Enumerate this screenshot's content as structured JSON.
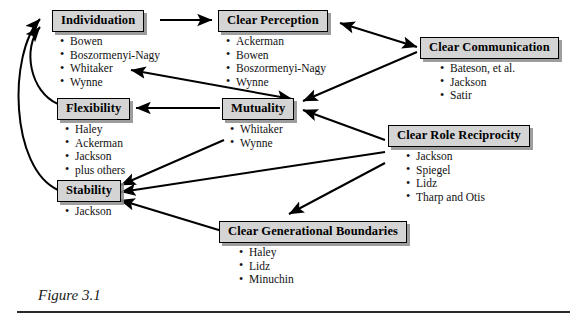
{
  "figure": {
    "caption": "Figure 3.1",
    "bullet_glyph": "•",
    "colors": {
      "box_fill": "#d4d4d4",
      "box_border": "#000000",
      "box_shadow": "#8c8c8c",
      "text": "#111111",
      "arrow": "#000000",
      "background": "#ffffff"
    }
  },
  "nodes": [
    {
      "id": "individuation",
      "title": "Individuation",
      "items": [
        "Bowen",
        "Boszormenyi-Nagy",
        "Whitaker",
        "Wynne"
      ]
    },
    {
      "id": "clear_perception",
      "title": "Clear Perception",
      "items": [
        "Ackerman",
        "Bowen",
        "Boszormenyi-Nagy",
        "Wynne"
      ]
    },
    {
      "id": "clear_communication",
      "title": "Clear Communication",
      "items": [
        "Bateson, et al.",
        "Jackson",
        "Satir"
      ]
    },
    {
      "id": "flexibility",
      "title": "Flexibility",
      "items": [
        "Haley",
        "Ackerman",
        "Jackson",
        "plus others"
      ]
    },
    {
      "id": "mutuality",
      "title": "Mutuality",
      "items": [
        "Whitaker",
        "Wynne"
      ]
    },
    {
      "id": "clear_role_reciprocity",
      "title": "Clear Role Reciprocity",
      "items": [
        "Jackson",
        "Spiegel",
        "Lidz",
        "Tharp and Otis"
      ]
    },
    {
      "id": "stability",
      "title": "Stability",
      "items": [
        "Jackson"
      ]
    },
    {
      "id": "clear_generational_boundaries",
      "title": "Clear Generational Boundaries",
      "items": [
        "Haley",
        "Lidz",
        "Minuchin"
      ]
    }
  ],
  "connections": [
    {
      "from": "individuation",
      "to": "clear_perception",
      "style": "straight",
      "heads": "end"
    },
    {
      "from": "clear_perception",
      "to": "clear_communication",
      "style": "straight",
      "heads": "both"
    },
    {
      "from": "clear_communication",
      "to": "mutuality",
      "style": "straight",
      "heads": "end"
    },
    {
      "from": "mutuality",
      "to": "individuation",
      "style": "straight",
      "heads": "both"
    },
    {
      "from": "mutuality",
      "to": "flexibility",
      "style": "straight",
      "heads": "end"
    },
    {
      "from": "mutuality",
      "to": "stability",
      "style": "straight",
      "heads": "end"
    },
    {
      "from": "clear_role_reciprocity",
      "to": "mutuality",
      "style": "straight",
      "heads": "end"
    },
    {
      "from": "clear_role_reciprocity",
      "to": "stability",
      "style": "straight",
      "heads": "end"
    },
    {
      "from": "clear_role_reciprocity",
      "to": "clear_generational_boundaries",
      "style": "straight",
      "heads": "end"
    },
    {
      "from": "clear_generational_boundaries",
      "to": "stability",
      "style": "straight",
      "heads": "end"
    },
    {
      "from": "flexibility",
      "to": "individuation",
      "style": "curved",
      "heads": "end"
    },
    {
      "from": "stability",
      "to": "individuation",
      "style": "curved",
      "heads": "end"
    }
  ]
}
